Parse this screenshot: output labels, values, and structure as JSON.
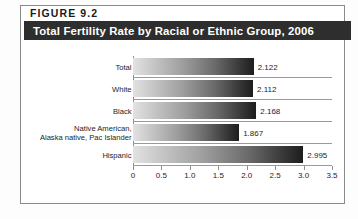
{
  "figure": {
    "number_label": "FIGURE  9.2",
    "title": "Total Fertility Rate by Racial or Ethnic Group, 2006"
  },
  "colors": {
    "banner_background": "#2e2e2e",
    "banner_text": "#ffffff",
    "frame_border": "#8a8a8a",
    "bar_gradient_start": "#e2e2e2",
    "bar_gradient_end": "#1d1d1d",
    "axis_line": "#8f8f8f",
    "page_background": "#ffffff"
  },
  "chart_data": {
    "type": "bar",
    "orientation": "horizontal",
    "title": "Total Fertility Rate by Racial or Ethnic Group, 2006",
    "xlabel": "",
    "ylabel": "",
    "xlim": [
      0,
      3.5
    ],
    "grid": false,
    "legend": "none",
    "categories": [
      "Total",
      "White",
      "Black",
      "Native American,\nAlaska native, Pac Islander",
      "Hispanic"
    ],
    "values": [
      2.122,
      2.112,
      2.168,
      1.867,
      2.995
    ],
    "value_labels": [
      "2.122",
      "2.112",
      "2.168",
      "1.867",
      "2.995"
    ],
    "xticks": [
      0,
      0.5,
      1.0,
      1.5,
      2.0,
      2.5,
      3.0,
      3.5
    ],
    "xtick_labels": [
      "0",
      "0.5",
      "1.0",
      "1.5",
      "2.0",
      "2.5",
      "3.0",
      "3.5"
    ]
  },
  "rows": [
    {
      "label": "Total",
      "value_label": "2.122"
    },
    {
      "label": "White",
      "value_label": "2.112"
    },
    {
      "label": "Black",
      "value_label": "2.168"
    },
    {
      "label_line1": "Native American,",
      "label_line2": "Alaska native, Pac Islander",
      "value_label": "1.867"
    },
    {
      "label": "Hispanic",
      "value_label": "2.995"
    }
  ]
}
